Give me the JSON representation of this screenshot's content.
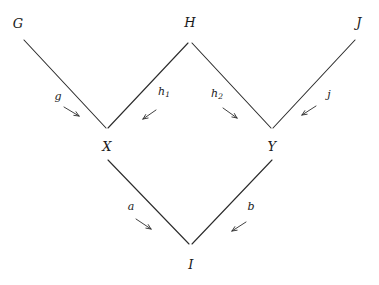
{
  "figure": {
    "type": "commutative-diagram",
    "background_color": "#ffffff",
    "stroke_color": "#2b2b2b",
    "text_color": "#1a1a1a",
    "width": 379,
    "height": 285
  },
  "nodes": [
    {
      "id": "G",
      "label": "G",
      "x": 18,
      "y": 23
    },
    {
      "id": "H",
      "label": "H",
      "x": 190,
      "y": 22
    },
    {
      "id": "J",
      "label": "J",
      "x": 359,
      "y": 22
    },
    {
      "id": "X",
      "label": "X",
      "x": 107,
      "y": 146
    },
    {
      "id": "Y",
      "label": "Y",
      "x": 272,
      "y": 146
    },
    {
      "id": "I",
      "label": "I",
      "x": 191,
      "y": 264
    }
  ],
  "edges": [
    {
      "id": "g",
      "label": "g",
      "sub": "",
      "from": "G",
      "to": "X",
      "line": {
        "x1": 24,
        "y1": 40,
        "x2": 106,
        "y2": 128
      },
      "label_pos": {
        "x": 58,
        "y": 96
      },
      "arrow": {
        "x1": 64,
        "y1": 107,
        "x2": 79,
        "y2": 116
      },
      "direction": "down-right"
    },
    {
      "id": "h1",
      "label": "h",
      "sub": "1",
      "from": "H",
      "to": "X",
      "line": {
        "x1": 188,
        "y1": 43,
        "x2": 108,
        "y2": 128
      },
      "label_pos": {
        "x": 164,
        "y": 92
      },
      "arrow": {
        "x1": 156,
        "y1": 110,
        "x2": 143,
        "y2": 119
      },
      "direction": "down-left"
    },
    {
      "id": "h2",
      "label": "h",
      "sub": "2",
      "from": "H",
      "to": "Y",
      "line": {
        "x1": 192,
        "y1": 43,
        "x2": 271,
        "y2": 128
      },
      "label_pos": {
        "x": 217,
        "y": 94
      },
      "arrow": {
        "x1": 223,
        "y1": 108,
        "x2": 237,
        "y2": 118
      },
      "direction": "down-right"
    },
    {
      "id": "j",
      "label": "j",
      "sub": "",
      "from": "J",
      "to": "Y",
      "line": {
        "x1": 355,
        "y1": 40,
        "x2": 273,
        "y2": 128
      },
      "label_pos": {
        "x": 329,
        "y": 94
      },
      "arrow": {
        "x1": 316,
        "y1": 106,
        "x2": 302,
        "y2": 115
      },
      "direction": "down-left"
    },
    {
      "id": "a",
      "label": "a",
      "sub": "",
      "from": "X",
      "to": "I",
      "line": {
        "x1": 108,
        "y1": 160,
        "x2": 189,
        "y2": 244
      },
      "label_pos": {
        "x": 131,
        "y": 206
      },
      "arrow": {
        "x1": 136,
        "y1": 219,
        "x2": 151,
        "y2": 229
      },
      "direction": "down-right"
    },
    {
      "id": "b",
      "label": "b",
      "sub": "",
      "from": "Y",
      "to": "I",
      "line": {
        "x1": 272,
        "y1": 160,
        "x2": 192,
        "y2": 244
      },
      "label_pos": {
        "x": 251,
        "y": 206
      },
      "arrow": {
        "x1": 246,
        "y1": 222,
        "x2": 232,
        "y2": 231
      },
      "direction": "down-left"
    }
  ]
}
